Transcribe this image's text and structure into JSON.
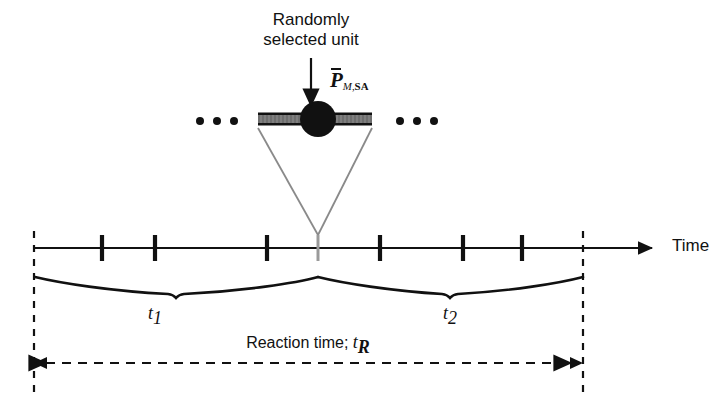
{
  "figure": {
    "domain": "diagram",
    "background_color": "#ffffff",
    "width": 725,
    "height": 399
  },
  "annotations": {
    "title_line1": "Randomly",
    "title_line2": "selected unit",
    "unit_symbol": {
      "base": "P",
      "overbar": true,
      "subscript_italic": "M",
      "subscript_separator": ",",
      "subscript_upright": "SA",
      "full_text": "P̄M,SA"
    },
    "time_axis_label": "Time",
    "reaction_label_text": "Reaction time; ",
    "reaction_symbol_base": "t",
    "reaction_symbol_subscript": "R",
    "interval_1": {
      "base": "t",
      "subscript": "1"
    },
    "interval_2": {
      "base": "t",
      "subscript": "2"
    },
    "ellipsis_left": "• • •",
    "ellipsis_right": "• • •"
  },
  "colors": {
    "stroke": "#111111",
    "bar_fill": "#6e6e6e",
    "bar_edge": "#111111",
    "cone_stroke": "#8a8a8a",
    "selected_tick": "#8a8a8a",
    "dashed": "#111111"
  },
  "geometry": {
    "axis": {
      "y": 248,
      "x_start": 34,
      "x_end": 660,
      "arrow_tip_x": 660
    },
    "tick_half_height": 13,
    "ticks": [
      {
        "x": 102,
        "selected": false
      },
      {
        "x": 155,
        "selected": false
      },
      {
        "x": 267,
        "selected": false
      },
      {
        "x": 318,
        "selected": true
      },
      {
        "x": 380,
        "selected": false
      },
      {
        "x": 463,
        "selected": false
      },
      {
        "x": 522,
        "selected": false
      }
    ],
    "dashed_verticals": [
      {
        "x": 34,
        "y_top": 231,
        "y_bottom": 392
      },
      {
        "x": 583,
        "y_top": 231,
        "y_bottom": 392
      }
    ],
    "unit_bar": {
      "x": 258,
      "y": 113,
      "width": 114,
      "height": 12
    },
    "unit_circle": {
      "cx": 318,
      "cy": 119,
      "r": 18
    },
    "selection_arrow": {
      "x": 311,
      "y_top": 58,
      "y_bottom": 110
    },
    "cone": {
      "left_x": 258,
      "right_x": 372,
      "top_y": 128,
      "apex_x": 318,
      "apex_y": 235
    },
    "brace_1": {
      "x_start": 35,
      "x_end": 318,
      "y_top": 277,
      "dip_x": 176,
      "dip_y": 296
    },
    "brace_2": {
      "x_start": 318,
      "x_end": 583,
      "y_top": 277,
      "dip_x": 450,
      "dip_y": 296
    },
    "reaction_arrow": {
      "y": 363,
      "x_left": 34,
      "x_right": 583
    },
    "ellipsis_dots_left": [
      200,
      217,
      234
    ],
    "ellipsis_dots_right": [
      400,
      417,
      434
    ],
    "ellipsis_dot_y": 121,
    "ellipsis_dot_r": 4
  },
  "labels_layout": {
    "title_x": 311,
    "title_y": 10,
    "unit_symbol_x": 330,
    "unit_symbol_y": 68,
    "time_x": 672,
    "time_y": 236,
    "t1_x": 155,
    "t1_y": 303,
    "t2_x": 438,
    "t2_y": 303,
    "reaction_x": 232,
    "reaction_y": 332
  }
}
